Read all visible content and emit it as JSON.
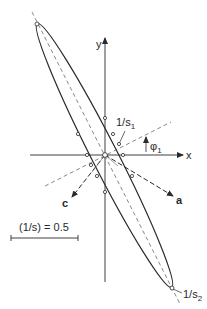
{
  "figure": {
    "type": "polar-ellipse-diagram",
    "axes": {
      "x_label": "x",
      "y_label": "y"
    },
    "labels": {
      "s1_num": "1/s",
      "s1_sub": "1",
      "s2_num": "1/s",
      "s2_sub": "2",
      "phi": "φ",
      "phi_sub": "1",
      "axis_a": "a",
      "axis_c": "c",
      "scale": "(1/s) = 0.5"
    },
    "colors": {
      "line": "#2a2a2a",
      "dashed": "#6a6a6a",
      "background": "#ffffff"
    }
  }
}
